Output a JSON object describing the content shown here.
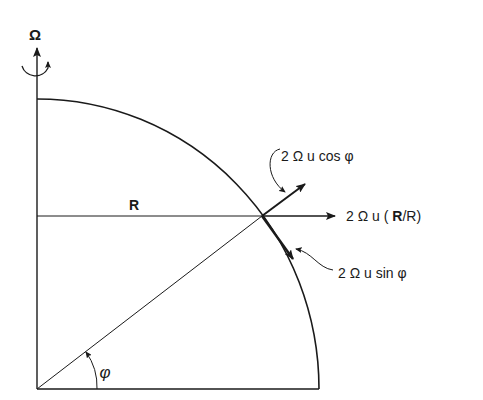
{
  "diagram": {
    "rotation_label": "Ω",
    "radius_label": "R",
    "angle_label": "φ",
    "vectors": [
      {
        "id": "radial",
        "label": "2 Ω u (R/R)",
        "parts": [
          "2 Ω u ( ",
          "R",
          "/R)"
        ]
      },
      {
        "id": "vertical",
        "label": "2 Ω u cos φ"
      },
      {
        "id": "tangential",
        "label": "2 Ω u sin φ"
      }
    ],
    "colors": {
      "ink": "#1a1a1a",
      "background": "#ffffff"
    }
  }
}
